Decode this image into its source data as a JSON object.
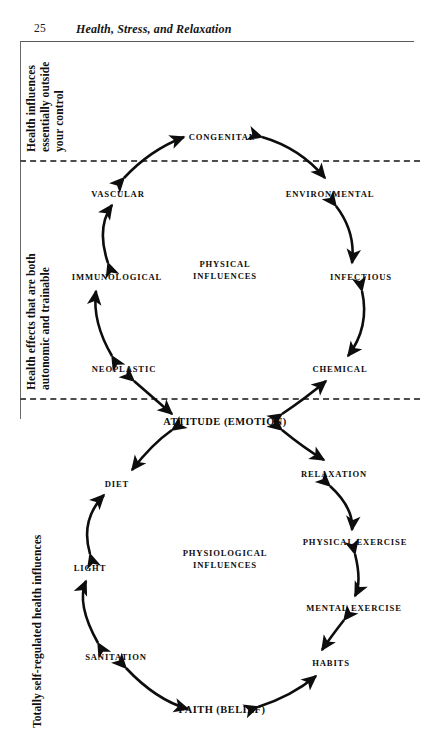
{
  "header": {
    "page_number": "25",
    "title": "Health, Stress, and Relaxation"
  },
  "bands": [
    {
      "id": "band1",
      "label": "Health influences\nessentially outside\nyour control"
    },
    {
      "id": "band2",
      "label": "Health effects that are both\nautonomic and trainable"
    },
    {
      "id": "band3",
      "label": "Totally self-regulated health influences"
    }
  ],
  "diagram": {
    "type": "dual-cycle-influence-diagram",
    "hub": {
      "label": "ATTITUDE (EMOTION)",
      "x": 225,
      "y": 421
    },
    "upper_cycle": {
      "center_label": "PHYSICAL\nINFLUENCES",
      "center_x": 225,
      "center_y": 270,
      "nodes": [
        {
          "name": "congenital",
          "label": "CONGENITAL",
          "x": 222,
          "y": 137
        },
        {
          "name": "vascular",
          "label": "VASCULAR",
          "x": 118,
          "y": 194
        },
        {
          "name": "environmental",
          "label": "ENVIRONMENTAL",
          "x": 330,
          "y": 194
        },
        {
          "name": "immunological",
          "label": "IMMUNOLOGICAL",
          "x": 117,
          "y": 277
        },
        {
          "name": "infectious",
          "label": "INFECTIOUS",
          "x": 361,
          "y": 277
        },
        {
          "name": "neoplastic",
          "label": "NEOPLASTIC",
          "x": 124,
          "y": 369
        },
        {
          "name": "chemical",
          "label": "CHEMICAL",
          "x": 340,
          "y": 369
        }
      ]
    },
    "lower_cycle": {
      "center_label": "PHYSIOLOGICAL\nINFLUENCES",
      "center_x": 225,
      "center_y": 559,
      "nodes": [
        {
          "name": "diet",
          "label": "DIET",
          "x": 117,
          "y": 484
        },
        {
          "name": "relaxation",
          "label": "RELAXATION",
          "x": 334,
          "y": 474
        },
        {
          "name": "light",
          "label": "LIGHT",
          "x": 90,
          "y": 568
        },
        {
          "name": "physical-exercise",
          "label": "PHYSICAL EXERCISE",
          "x": 355,
          "y": 542
        },
        {
          "name": "mental-exercise",
          "label": "MENTAL EXERCISE",
          "x": 354,
          "y": 608
        },
        {
          "name": "sanitation",
          "label": "SANITATION",
          "x": 116,
          "y": 657
        },
        {
          "name": "habits",
          "label": "HABITS",
          "x": 331,
          "y": 663
        },
        {
          "name": "faith",
          "label": "FAITH (BELIEF)",
          "x": 222,
          "y": 709
        }
      ]
    },
    "connectors": [
      {
        "from": "vascular",
        "to": "congenital",
        "double_headed": true
      },
      {
        "from": "congenital",
        "to": "environmental",
        "double_headed": true
      },
      {
        "from": "immunological",
        "to": "vascular",
        "double_headed": true
      },
      {
        "from": "environmental",
        "to": "infectious",
        "double_headed": true
      },
      {
        "from": "neoplastic",
        "to": "immunological",
        "double_headed": true
      },
      {
        "from": "infectious",
        "to": "chemical",
        "double_headed": true
      },
      {
        "from": "neoplastic",
        "to": "hub",
        "double_headed": true
      },
      {
        "from": "hub",
        "to": "chemical",
        "double_headed": true
      },
      {
        "from": "hub",
        "to": "diet",
        "double_headed": true
      },
      {
        "from": "hub",
        "to": "relaxation",
        "double_headed": true
      },
      {
        "from": "light",
        "to": "diet",
        "double_headed": true
      },
      {
        "from": "relaxation",
        "to": "physical-exercise",
        "double_headed": true
      },
      {
        "from": "sanitation",
        "to": "light",
        "double_headed": true
      },
      {
        "from": "physical-exercise",
        "to": "mental-exercise",
        "double_headed": true
      },
      {
        "from": "sanitation",
        "to": "faith",
        "double_headed": true
      },
      {
        "from": "mental-exercise",
        "to": "habits",
        "double_headed": true
      },
      {
        "from": "faith",
        "to": "habits",
        "double_headed": true
      }
    ],
    "dividers": [
      {
        "name": "divider-upper",
        "y": 160
      },
      {
        "name": "divider-lower",
        "y": 398
      }
    ]
  },
  "colors": {
    "ink": "#0d0d0d",
    "rule": "#5a5a5a",
    "dash": "#4c4c4c",
    "background": "#ffffff"
  }
}
